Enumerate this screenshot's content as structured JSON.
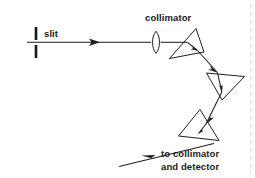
{
  "figure": {
    "background_color": "#ffffff",
    "ink_color": "#1f1f1f",
    "width": 255,
    "height": 178,
    "labels": {
      "slit": "slit",
      "collimator": "collimator",
      "output_line1": "to collimator",
      "output_line2": "and detector"
    },
    "components": [
      {
        "name": "slit",
        "type": "aperture",
        "label": "slit",
        "upper_bar": {
          "x": 36,
          "y1": 27,
          "y2": 40
        },
        "lower_bar": {
          "x": 36,
          "y1": 45,
          "y2": 58
        },
        "bar_width": 2.6
      },
      {
        "name": "collimator-lens",
        "type": "lens",
        "label": "collimator",
        "center": {
          "x": 156,
          "y": 42
        },
        "half_width": 5.0,
        "half_height": 11.0
      },
      {
        "name": "prism-1",
        "type": "prism",
        "vertices": [
          [
            196,
            29
          ],
          [
            170,
            58
          ],
          [
            204,
            52
          ]
        ]
      },
      {
        "name": "prism-2",
        "type": "prism",
        "vertices": [
          [
            207,
            73
          ],
          [
            244,
            76
          ],
          [
            222,
            100
          ]
        ]
      },
      {
        "name": "prism-3",
        "type": "prism",
        "vertices": [
          [
            200,
            110
          ],
          [
            179,
            136
          ],
          [
            219,
            140
          ]
        ]
      }
    ],
    "rays": [
      {
        "name": "incident-beam",
        "from": [
          28,
          42
        ],
        "to": [
          156,
          42
        ],
        "arrow_at": [
          96,
          42
        ],
        "arrow_direction": "right"
      },
      {
        "name": "lens-to-prism1",
        "from": [
          161,
          42
        ],
        "to": [
          186,
          42
        ]
      },
      {
        "name": "prism1-internal",
        "from": [
          186,
          42
        ],
        "to": [
          196,
          49
        ],
        "arrow_at": [
          194,
          47.5
        ],
        "arrow_direction": "down-right"
      },
      {
        "name": "prism1-to-prism2",
        "from": [
          196,
          49
        ],
        "to": [
          216,
          71
        ],
        "arrow_at": [
          213,
          67
        ],
        "arrow_direction": "down-right"
      },
      {
        "name": "prism2-internal",
        "from": [
          216,
          71
        ],
        "to": [
          222,
          90
        ],
        "arrow_at": [
          221,
          86
        ],
        "arrow_direction": "down"
      },
      {
        "name": "prism2-to-prism3",
        "from": [
          222,
          90
        ],
        "to": [
          208,
          122
        ],
        "arrow_at": [
          210,
          117
        ],
        "arrow_direction": "down-left"
      },
      {
        "name": "prism3-internal",
        "from": [
          208,
          122
        ],
        "to": [
          200,
          131
        ],
        "arrow_at": [
          201,
          129
        ],
        "arrow_direction": "down-left"
      },
      {
        "name": "exit-beam",
        "from": [
          213,
          143
        ],
        "to": [
          120,
          166
        ],
        "arrow_at": [
          147,
          159
        ],
        "arrow_direction": "left-down"
      }
    ],
    "label_positions": {
      "slit": {
        "x": 44,
        "y": 36
      },
      "collimator": {
        "x": 145,
        "y": 21
      },
      "output_line1": {
        "x": 162,
        "y": 157
      },
      "output_line2": {
        "x": 162,
        "y": 170
      }
    }
  }
}
